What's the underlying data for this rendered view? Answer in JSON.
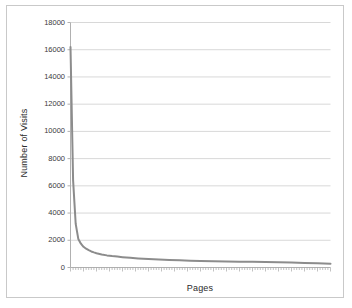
{
  "chart_data": {
    "type": "line",
    "title": "",
    "xlabel": "Pages",
    "ylabel": "Number of Visits",
    "ylim": [
      0,
      18000
    ],
    "ytick_labels": [
      "18000",
      "16000",
      "14000",
      "12000",
      "10000",
      "8000",
      "6000",
      "4000",
      "2000",
      "0"
    ],
    "ytick_values": [
      18000,
      16000,
      14000,
      12000,
      10000,
      8000,
      6000,
      4000,
      2000,
      0
    ],
    "xtick_labels": [],
    "grid": "horizontal",
    "legend": "none",
    "line_color": "#8c8c8c",
    "gridline_color": "#d8d8d8",
    "axis_color": "#b0b0b0",
    "background_color": "#ffffff",
    "border_color": "#c9c9c9",
    "x_minor_tick_count": 100,
    "series": [
      {
        "name": "Number of Visits",
        "x": [
          0,
          1,
          2,
          3,
          4,
          5,
          6,
          7,
          8,
          9,
          10,
          12,
          14,
          16,
          18,
          20,
          23,
          26,
          30,
          34,
          38,
          42,
          46,
          50,
          55,
          60,
          65,
          70,
          75,
          80,
          85,
          90,
          95,
          100
        ],
        "values": [
          16200,
          6400,
          3200,
          2100,
          1750,
          1520,
          1380,
          1270,
          1180,
          1110,
          1050,
          960,
          890,
          840,
          800,
          760,
          710,
          670,
          620,
          580,
          550,
          525,
          500,
          480,
          460,
          445,
          430,
          415,
          400,
          385,
          360,
          335,
          305,
          270
        ]
      }
    ]
  },
  "axes": {
    "y_title": "Number of Visits",
    "x_title": "Pages"
  }
}
